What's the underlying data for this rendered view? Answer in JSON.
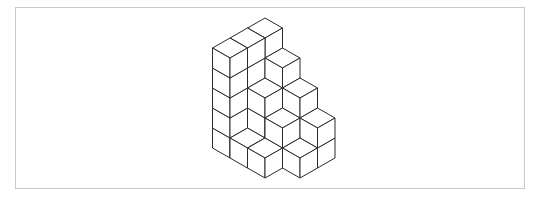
{
  "figure": {
    "stroke_color": "#2b2b2b",
    "face_color": "#ffffff",
    "frame_color": "#c9c9c9",
    "projection": {
      "origin_x": 265,
      "origin_y": 118,
      "half_width": 17.5,
      "half_height": 10,
      "edge_height": 20
    },
    "heightmap": [
      [
        5,
        5,
        5
      ],
      [
        4,
        3,
        1
      ],
      [
        3,
        2,
        1
      ],
      [
        2,
        1,
        0
      ]
    ]
  }
}
